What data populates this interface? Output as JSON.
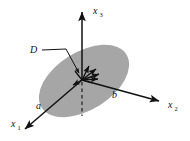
{
  "figure": {
    "background_color": "#ffffff",
    "stroke_color": "#111111",
    "disk": {
      "label": "D",
      "fill_color": "#a6a6a6",
      "center_x": 84,
      "center_y": 81,
      "radius_x": 50,
      "radius_y": 29,
      "rotation_deg": -32
    },
    "axes": [
      {
        "name": "x3",
        "label_base": "x",
        "label_sub": "3",
        "label_x": 95,
        "label_y": 13,
        "x1": 82,
        "y1": 80,
        "x2": 82,
        "y2": 8
      },
      {
        "name": "x2",
        "label_base": "x",
        "label_sub": "2",
        "label_x": 170,
        "label_y": 108,
        "x1": 82,
        "y1": 80,
        "x2": 163,
        "y2": 102
      },
      {
        "name": "x1",
        "label_base": "x",
        "label_sub": "1",
        "label_x": 13,
        "label_y": 128,
        "x1": 82,
        "y1": 80,
        "x2": 21,
        "y2": 133
      }
    ],
    "vectors": [
      {
        "name": "a",
        "label": "a",
        "label_x": 38,
        "label_y": 108
      },
      {
        "name": "b",
        "label": "b",
        "label_x": 113,
        "label_y": 97
      }
    ],
    "region_leader": {
      "label": "D",
      "label_x": 32,
      "label_y": 53,
      "path": "M 42 50 L 66 49 L 80 72"
    },
    "dashed_drop_line": {
      "x": 82,
      "y_top": 82,
      "y_bottom": 116
    },
    "origin_arrow_cluster": {
      "count": 6,
      "origin_x": 82,
      "origin_y": 80
    }
  }
}
